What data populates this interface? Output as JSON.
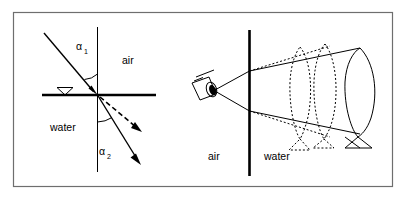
{
  "figure": {
    "background_color": "#ffffff",
    "ink_color": "#000000",
    "frame_color": "#6e6e6e",
    "panels": [
      {
        "id": "left-panel",
        "name": "snells-law-refraction-diagram",
        "labels": {
          "medium_upper": "air",
          "medium_lower": "water",
          "angle_incident": "α",
          "angle_incident_sub": "1",
          "angle_refracted": "α",
          "angle_refracted_sub": "2"
        },
        "elements": {
          "interface_line": "horizontal-water-surface",
          "normal_line": "vertical-normal",
          "water_level_marker": "inverted-triangle",
          "incident_ray": "solid-arrow-downward-right",
          "refracted_ray_solid": "solid-arrow-steep",
          "refracted_ray_dashed": "dashed-arrow-shallow"
        }
      },
      {
        "id": "right-panel",
        "name": "camera-viewing-submerged-object-diagram",
        "labels": {
          "medium_left": "air",
          "medium_right": "water"
        },
        "elements": {
          "interface_line": "vertical-water-surface",
          "camera": "camera-icon",
          "real_object": "solid-fish-outline",
          "virtual_image_near": "dotted-fish-outline-near",
          "virtual_image_far": "dotted-fish-outline-far",
          "sight_rays_solid": "solid-ray-pair",
          "sight_rays_dotted": "dotted-ray-pair"
        }
      }
    ]
  }
}
